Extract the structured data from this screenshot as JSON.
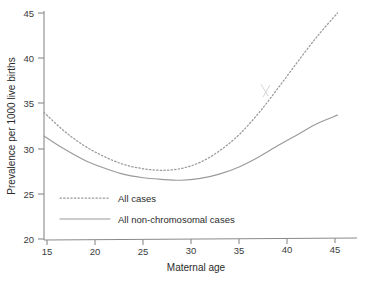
{
  "chart_data": {
    "type": "line",
    "title": "",
    "xlabel": "Maternal age",
    "ylabel": "Prevalence per 1000 live births",
    "xlim": [
      15,
      47
    ],
    "ylim": [
      20,
      45
    ],
    "xticks": [
      15,
      20,
      25,
      30,
      35,
      40,
      45
    ],
    "yticks": [
      20,
      25,
      30,
      35,
      40,
      45
    ],
    "xtick_labels": [
      "15",
      "20",
      "25",
      "30",
      "35",
      "40",
      "45"
    ],
    "ytick_labels": [
      "20",
      "25",
      "30",
      "35",
      "40",
      "45"
    ],
    "grid": false,
    "legend_position": "lower-left-inside",
    "x": [
      15,
      17,
      19,
      21,
      23,
      25,
      27,
      29,
      31,
      33,
      35,
      37,
      39,
      41,
      43,
      45
    ],
    "series": [
      {
        "name": "All cases",
        "style": "dotted",
        "color": "#9a9a9a",
        "values": [
          34.0,
          32.0,
          30.4,
          29.2,
          28.3,
          27.8,
          27.6,
          27.8,
          28.5,
          29.8,
          31.6,
          34.0,
          36.8,
          39.7,
          42.5,
          45.0
        ]
      },
      {
        "name": "All non-chromosomal cases",
        "style": "solid",
        "color": "#9a9a9a",
        "values": [
          31.4,
          30.0,
          28.8,
          27.9,
          27.2,
          26.8,
          26.6,
          26.5,
          26.7,
          27.2,
          28.0,
          29.1,
          30.4,
          31.6,
          32.8,
          33.7
        ]
      }
    ],
    "annotations": []
  },
  "legend": {
    "items": [
      {
        "label": "All cases"
      },
      {
        "label": "All non-chromosomal cases"
      }
    ]
  },
  "axes": {
    "x_title": "Maternal age",
    "y_title": "Prevalence per 1000 live births"
  }
}
